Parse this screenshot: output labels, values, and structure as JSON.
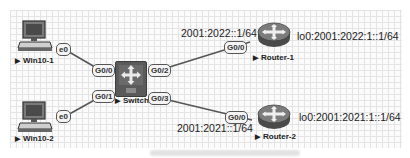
{
  "diagram": {
    "nodes": {
      "win10_1": {
        "label": "Win10-1",
        "port": "e0"
      },
      "win10_2": {
        "label": "Win10-2",
        "port": "e0"
      },
      "switch": {
        "label": "Switch",
        "ports": {
          "g00": "G0/0",
          "g01": "G0/1",
          "g02": "G0/2",
          "g03": "G0/3"
        }
      },
      "router_1": {
        "label": "Router-1",
        "port": "G0/0",
        "interface_ip": "2001:2022::1/64",
        "loopback_ip": "lo0:2001:2022:1::1/64"
      },
      "router_2": {
        "label": "Router-2",
        "port": "G0/0",
        "interface_ip": "2001:2021::1/64",
        "loopback_ip": "lo0:2001:2021:1::1/64"
      }
    },
    "links": [
      {
        "from": "Win10-1 e0",
        "to": "Switch G0/0"
      },
      {
        "from": "Win10-2 e0",
        "to": "Switch G0/1"
      },
      {
        "from": "Switch G0/2",
        "to": "Router-1 G0/0"
      },
      {
        "from": "Switch G0/3",
        "to": "Router-2 G0/0"
      }
    ],
    "arrow_glyph": "▶",
    "colors": {
      "link": "#555555",
      "device_dark": "#5a5a5a",
      "router_body": "#6e6e6e"
    }
  }
}
